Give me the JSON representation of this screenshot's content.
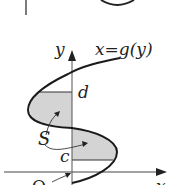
{
  "diagram": {
    "labels": {
      "y_axis": "y",
      "x_axis": "x",
      "function": "x=g(y)",
      "upper_bound": "d",
      "lower_bound": "c",
      "region": "S",
      "origin": "O"
    },
    "colors": {
      "line": "#1a1a1a",
      "axis": "#333333",
      "fill": "#d4d4d4",
      "background": "#ffffff"
    }
  }
}
